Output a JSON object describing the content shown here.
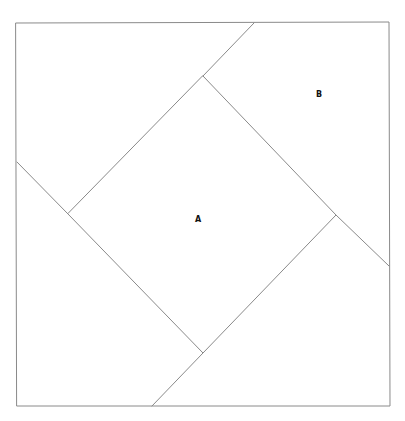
{
  "diagram": {
    "type": "geometric-dissection",
    "outer_square": {
      "top_left": [
        16,
        23
      ],
      "top_right": [
        389,
        22
      ],
      "bottom_right": [
        390,
        406
      ],
      "bottom_left": [
        17,
        406
      ]
    },
    "inner_square": {
      "top": [
        203,
        76
      ],
      "right": [
        336,
        215
      ],
      "bottom": [
        203,
        353
      ],
      "left": [
        68,
        214
      ]
    },
    "extension_segments": [
      {
        "from": [
          203,
          76
        ],
        "to": [
          254,
          23
        ]
      },
      {
        "from": [
          336,
          215
        ],
        "to": [
          389,
          266
        ]
      },
      {
        "from": [
          203,
          353
        ],
        "to": [
          152,
          406
        ]
      },
      {
        "from": [
          68,
          214
        ],
        "to": [
          17,
          162
        ]
      }
    ],
    "labels": [
      {
        "id": "A",
        "text": "A",
        "x": 198,
        "y": 222,
        "region": "inner tilted square"
      },
      {
        "id": "B",
        "text": "B",
        "x": 319,
        "y": 97,
        "region": "upper-right pinwheel region"
      }
    ],
    "colors": {
      "line": "#8a8a8a",
      "label": "#111111",
      "background": "#ffffff"
    }
  }
}
